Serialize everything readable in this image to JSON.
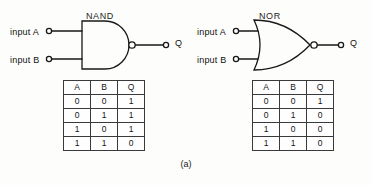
{
  "figure": {
    "caption": "(a)",
    "ink_color": "#1a1a1a",
    "background_color": "#fdfdfb"
  },
  "gates": [
    {
      "name": "NAND",
      "title": "NAND",
      "input_a_label": "input A",
      "input_b_label": "input B",
      "output_label": "Q",
      "shape": "and-with-bubble",
      "truth_table": {
        "headers": [
          "A",
          "B",
          "Q"
        ],
        "rows": [
          [
            "0",
            "0",
            "1"
          ],
          [
            "0",
            "1",
            "1"
          ],
          [
            "1",
            "0",
            "1"
          ],
          [
            "1",
            "1",
            "0"
          ]
        ]
      }
    },
    {
      "name": "NOR",
      "title": "NOR",
      "input_a_label": "input A",
      "input_b_label": "input B",
      "output_label": "Q",
      "shape": "or-with-bubble",
      "truth_table": {
        "headers": [
          "A",
          "B",
          "Q"
        ],
        "rows": [
          [
            "0",
            "0",
            "1"
          ],
          [
            "0",
            "1",
            "0"
          ],
          [
            "1",
            "0",
            "0"
          ],
          [
            "1",
            "1",
            "0"
          ]
        ]
      }
    }
  ]
}
